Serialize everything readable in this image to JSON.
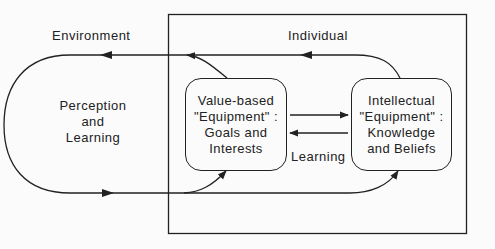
{
  "diagram": {
    "environment_label": "Environment",
    "individual_label": "Individual",
    "perception": [
      "Perception",
      "and",
      "Learning"
    ],
    "value_box": [
      "Value-based",
      "\"Equipment\" :",
      "Goals and",
      "Interests"
    ],
    "intellectual_box": [
      "Intellectual",
      "\"Equipment\" :",
      "Knowledge",
      "and Beliefs"
    ],
    "learning_label": "Learning",
    "colors": {
      "line": "#222222",
      "background": "#fbfbfb"
    }
  }
}
